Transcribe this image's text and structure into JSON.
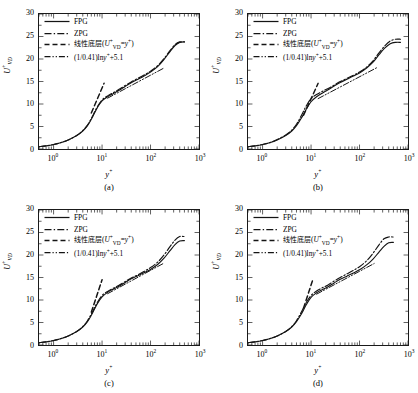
{
  "figure": {
    "panels": [
      {
        "caption": "(a)",
        "id": "a"
      },
      {
        "caption": "(b)",
        "id": "b"
      },
      {
        "caption": "(c)",
        "id": "c"
      },
      {
        "caption": "(d)",
        "id": "d"
      }
    ],
    "legend": [
      {
        "label": "FPG",
        "style": "solid",
        "kind": "latin"
      },
      {
        "label": "ZPG",
        "style": "dashdot",
        "kind": "latin"
      },
      {
        "label": "线性底层(U+VD = y+)",
        "style": "dashed",
        "kind": "cn-formula"
      },
      {
        "label": "(1/0.41)lny+ + 5.1",
        "style": "dashdotdot",
        "kind": "formula"
      }
    ],
    "legend_parts": {
      "fpg": "FPG",
      "zpg": "ZPG",
      "sublayer_cn": "线性底层",
      "sublayer_open": "(",
      "sublayer_u": "U",
      "sublayer_u_sup": "+",
      "sublayer_u_sub": "VD",
      "sublayer_eq": "=",
      "sublayer_y": "y",
      "sublayer_y_sup": "+",
      "sublayer_close": ")",
      "loglaw_coef": "(1/0.41)ln",
      "loglaw_y": "y",
      "loglaw_y_sup": "+",
      "loglaw_tail": "+5.1"
    },
    "axes": {
      "ylabel_main": "U",
      "ylabel_sup": "+",
      "ylabel_sub": "VD",
      "xlabel_main": "y",
      "xlabel_sup": "+",
      "yticks": [
        "0",
        "5",
        "10",
        "15",
        "20",
        "25",
        "30"
      ],
      "xticks": [
        "10⁰",
        "10¹",
        "10²",
        "10³"
      ],
      "xtick_base": "10",
      "xtick_exps": [
        "0",
        "1",
        "2",
        "3"
      ]
    }
  },
  "chart_data": {
    "type": "line",
    "xlabel": "y+",
    "ylabel": "U+VD",
    "xscale": "log",
    "xlim": [
      0.5,
      1000
    ],
    "ylim": [
      0,
      30
    ],
    "grid": false,
    "legend_position": "upper-left",
    "panels": [
      {
        "name": "(a)",
        "series": [
          {
            "name": "FPG",
            "style": "solid",
            "x": [
              0.5,
              0.7,
              1.0,
              1.5,
              2.0,
              3.0,
              4.0,
              5.0,
              6.0,
              7.0,
              8.0,
              10.0,
              13.0,
              17.0,
              22.0,
              30.0,
              40.0,
              55.0,
              75.0,
              100.0,
              140.0,
              190.0,
              250.0,
              320.0,
              400.0,
              500.0
            ],
            "y": [
              0.5,
              0.7,
              1.0,
              1.5,
              2.0,
              3.0,
              4.0,
              5.2,
              6.6,
              8.0,
              9.2,
              10.7,
              11.6,
              12.3,
              13.0,
              13.9,
              14.7,
              15.5,
              16.3,
              17.1,
              18.3,
              19.9,
              21.6,
              23.0,
              23.7,
              23.8
            ]
          },
          {
            "name": "ZPG",
            "style": "dashdot",
            "x": [
              0.5,
              0.7,
              1.0,
              1.5,
              2.0,
              3.0,
              4.0,
              5.0,
              6.0,
              7.0,
              8.0,
              10.0,
              13.0,
              17.0,
              22.0,
              30.0,
              40.0,
              55.0,
              75.0,
              100.0,
              140.0,
              190.0,
              250.0,
              320.0,
              400.0,
              500.0
            ],
            "y": [
              0.5,
              0.7,
              1.0,
              1.5,
              2.0,
              3.0,
              4.1,
              5.3,
              6.8,
              8.2,
              9.4,
              10.9,
              11.8,
              12.5,
              13.2,
              14.1,
              14.9,
              15.7,
              16.5,
              17.3,
              18.5,
              20.1,
              21.8,
              23.2,
              23.8,
              23.8
            ]
          },
          {
            "name": "linear sublayer",
            "style": "dashed",
            "x": [
              6.0,
              11.0
            ],
            "y": [
              8.0,
              14.6
            ]
          },
          {
            "name": "log law",
            "style": "dashdotdot",
            "x": [
              13.0,
              190.0
            ],
            "y": [
              11.3,
              18.0
            ]
          }
        ]
      },
      {
        "name": "(b)",
        "series": [
          {
            "name": "FPG",
            "style": "solid",
            "x": [
              0.5,
              0.7,
              1.0,
              1.5,
              2.0,
              3.0,
              4.0,
              5.0,
              6.0,
              7.0,
              8.0,
              10.0,
              13.0,
              17.0,
              22.0,
              30.0,
              40.0,
              55.0,
              75.0,
              100.0,
              140.0,
              190.0,
              250.0,
              330.0,
              430.0,
              560.0,
              700.0
            ],
            "y": [
              0.5,
              0.7,
              1.0,
              1.5,
              2.0,
              3.0,
              4.0,
              5.2,
              6.5,
              7.7,
              8.9,
              10.5,
              11.6,
              12.4,
              13.1,
              14.0,
              14.8,
              15.5,
              16.2,
              16.9,
              18.0,
              19.3,
              20.9,
              22.4,
              23.4,
              23.7,
              23.7
            ]
          },
          {
            "name": "ZPG",
            "style": "dashdot",
            "x": [
              0.5,
              0.7,
              1.0,
              1.5,
              2.0,
              3.0,
              4.0,
              5.0,
              6.0,
              7.0,
              8.0,
              10.0,
              13.0,
              17.0,
              22.0,
              30.0,
              40.0,
              55.0,
              75.0,
              100.0,
              140.0,
              190.0,
              250.0,
              330.0,
              430.0,
              560.0,
              700.0
            ],
            "y": [
              0.5,
              0.7,
              1.0,
              1.5,
              2.1,
              3.1,
              4.2,
              5.5,
              7.0,
              8.4,
              9.6,
              11.2,
              12.1,
              12.8,
              13.4,
              14.2,
              15.0,
              15.7,
              16.4,
              17.1,
              18.2,
              19.6,
              21.3,
              22.9,
              24.0,
              24.4,
              24.4
            ]
          },
          {
            "name": "linear sublayer",
            "style": "dashed",
            "x": [
              7.0,
              14.0
            ],
            "y": [
              7.5,
              14.6
            ]
          },
          {
            "name": "log law",
            "style": "dashdotdot",
            "x": [
              14.0,
              230.0
            ],
            "y": [
              11.2,
              18.1
            ]
          }
        ]
      },
      {
        "name": "(c)",
        "series": [
          {
            "name": "FPG",
            "style": "solid",
            "x": [
              0.5,
              0.7,
              1.0,
              1.5,
              2.0,
              3.0,
              4.0,
              5.0,
              6.0,
              7.0,
              8.0,
              10.0,
              13.0,
              17.0,
              22.0,
              30.0,
              40.0,
              55.0,
              75.0,
              100.0,
              140.0,
              190.0,
              250.0,
              320.0,
              400.0,
              500.0
            ],
            "y": [
              0.5,
              0.7,
              1.0,
              1.5,
              2.0,
              3.0,
              4.0,
              5.2,
              6.6,
              8.0,
              9.2,
              10.7,
              11.7,
              12.4,
              13.0,
              13.9,
              14.7,
              15.4,
              16.1,
              16.8,
              17.9,
              19.3,
              20.9,
              22.3,
              23.1,
              23.2
            ]
          },
          {
            "name": "ZPG",
            "style": "dashdot",
            "x": [
              0.5,
              0.7,
              1.0,
              1.5,
              2.0,
              3.0,
              4.0,
              5.0,
              6.0,
              7.0,
              8.0,
              10.0,
              13.0,
              17.0,
              22.0,
              30.0,
              40.0,
              55.0,
              75.0,
              100.0,
              140.0,
              190.0,
              250.0,
              320.0,
              400.0,
              500.0
            ],
            "y": [
              0.5,
              0.7,
              1.0,
              1.5,
              2.0,
              3.0,
              4.1,
              5.4,
              6.9,
              8.3,
              9.5,
              11.0,
              11.9,
              12.6,
              13.2,
              14.1,
              14.9,
              15.6,
              16.4,
              17.2,
              18.4,
              20.0,
              21.8,
              23.3,
              24.1,
              24.1
            ]
          },
          {
            "name": "linear sublayer",
            "style": "dashed",
            "x": [
              6.0,
              10.0
            ],
            "y": [
              7.3,
              14.5
            ]
          },
          {
            "name": "log law",
            "style": "dashdotdot",
            "x": [
              13.0,
              190.0
            ],
            "y": [
              11.4,
              18.2
            ]
          }
        ]
      },
      {
        "name": "(d)",
        "series": [
          {
            "name": "FPG",
            "style": "solid",
            "x": [
              0.5,
              0.7,
              1.0,
              1.5,
              2.0,
              3.0,
              4.0,
              5.0,
              6.0,
              7.0,
              8.0,
              10.0,
              13.0,
              17.0,
              22.0,
              30.0,
              40.0,
              55.0,
              75.0,
              100.0,
              140.0,
              190.0,
              250.0,
              320.0,
              400.0,
              500.0
            ],
            "y": [
              0.5,
              0.7,
              1.0,
              1.5,
              2.0,
              3.0,
              4.0,
              5.2,
              6.5,
              7.8,
              9.0,
              10.6,
              11.6,
              12.3,
              12.9,
              13.8,
              14.6,
              15.3,
              16.0,
              16.7,
              17.8,
              19.1,
              20.6,
              21.9,
              22.7,
              22.8
            ]
          },
          {
            "name": "ZPG",
            "style": "dashdot",
            "x": [
              0.5,
              0.7,
              1.0,
              1.5,
              2.0,
              3.0,
              4.0,
              5.0,
              6.0,
              7.0,
              8.0,
              10.0,
              13.0,
              17.0,
              22.0,
              30.0,
              40.0,
              55.0,
              75.0,
              100.0,
              140.0,
              190.0,
              250.0,
              320.0,
              400.0,
              500.0
            ],
            "y": [
              0.5,
              0.7,
              1.0,
              1.5,
              2.0,
              3.0,
              4.1,
              5.4,
              6.9,
              8.3,
              9.5,
              11.0,
              12.0,
              12.7,
              13.3,
              14.2,
              15.0,
              15.8,
              16.6,
              17.4,
              18.7,
              20.4,
              22.2,
              23.6,
              24.0,
              24.0
            ]
          },
          {
            "name": "linear sublayer",
            "style": "dashed",
            "x": [
              7.0,
              11.0
            ],
            "y": [
              8.2,
              14.7
            ]
          },
          {
            "name": "log law",
            "style": "dashdotdot",
            "x": [
              13.0,
              200.0
            ],
            "y": [
              11.3,
              18.1
            ]
          }
        ]
      }
    ]
  }
}
